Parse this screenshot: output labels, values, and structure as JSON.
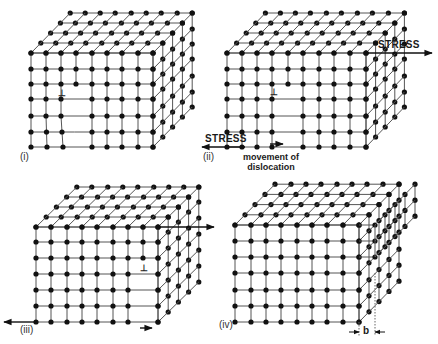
{
  "figure": {
    "colors": {
      "line": "#555555",
      "dot": "#111111",
      "arrow": "#111111",
      "background": "#ffffff"
    }
  },
  "panels": [
    {
      "id": "i",
      "label": "(i)",
      "label_pos": [
        20,
        152
      ],
      "front_x": [
        31,
        46,
        61,
        76,
        92,
        107,
        122,
        138,
        153
      ],
      "rows_y": [
        53,
        69,
        84,
        99,
        116,
        132,
        147
      ],
      "depth": 4,
      "dx": 9.8,
      "dy": -10,
      "dislocation": {
        "col": 3,
        "row": 2,
        "symbol": "⊥",
        "pos": [
          58,
          89
        ]
      },
      "distortion": {
        "bottom_shift": [
          [
            1,
            1
          ],
          [
            2,
            2
          ],
          [
            3,
            3
          ]
        ]
      }
    },
    {
      "id": "ii",
      "label": "(ii)",
      "label_pos": [
        203,
        152
      ],
      "front_x": [
        227,
        242,
        257,
        272,
        288,
        303,
        319,
        334,
        350,
        366
      ],
      "rows_y": [
        53,
        69,
        84,
        99,
        116,
        132,
        147
      ],
      "depth": 4,
      "dx": 9.6,
      "dy": -10,
      "dislocation": {
        "col": 4,
        "row": 2,
        "symbol": "⊥",
        "pos": [
          270,
          88
        ]
      },
      "stress_right": {
        "text": "STRESS",
        "arrow_from": [
          366,
          53
        ],
        "arrow_to": [
          432,
          53
        ],
        "text_pos": [
          378,
          40
        ]
      },
      "stress_left": {
        "text": "STRESS",
        "arrow_from": [
          245,
          147
        ],
        "arrow_to": [
          202,
          147
        ],
        "text_pos": [
          205,
          134
        ]
      },
      "movement": {
        "line1": "movement of",
        "line2": "dislocation",
        "text_pos": [
          243,
          152
        ],
        "arrow_from": [
          270,
          144
        ],
        "arrow_to": [
          283,
          144
        ]
      }
    },
    {
      "id": "iii",
      "label": "(iii)",
      "label_pos": [
        20,
        325
      ],
      "front_x": [
        36,
        51,
        67,
        82,
        97,
        113,
        128,
        143,
        158
      ],
      "rows_y": [
        227,
        242,
        258,
        274,
        290,
        306,
        322
      ],
      "depth": 4,
      "dx": 10.2,
      "dy": -10,
      "dislocation": {
        "col": 7,
        "row": 2,
        "symbol": "⊥",
        "pos": [
          140,
          264
        ]
      },
      "stress_right": {
        "arrow_from": [
          158,
          227
        ],
        "arrow_to": [
          214,
          227
        ]
      },
      "stress_left": {
        "arrow_from": [
          36,
          322
        ],
        "arrow_to": [
          4,
          322
        ]
      },
      "movement": {
        "arrow_from": [
          140,
          328
        ],
        "arrow_to": [
          152,
          328
        ]
      }
    },
    {
      "id": "iv",
      "label": "(iv)",
      "label_pos": [
        219,
        320
      ],
      "front_x": [
        235,
        251,
        266,
        281,
        297,
        312,
        327,
        343,
        359
      ],
      "rows_y": [
        225,
        241,
        257,
        273,
        290,
        306,
        322
      ],
      "depth": 4,
      "dx": 10,
      "dy": -10.2,
      "step": {
        "rows_above": 3,
        "extra_x": 375
      },
      "burgers": {
        "symbol": "b",
        "x1": 359,
        "x2": 375,
        "y": 332,
        "text_pos": [
          363,
          326
        ]
      }
    }
  ]
}
